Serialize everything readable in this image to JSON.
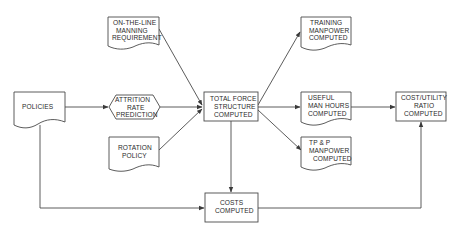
{
  "diagram": {
    "type": "flowchart",
    "background": "#ffffff",
    "line_color": "#4a4a4a",
    "text_color": "#2a2a2a",
    "nodes": [
      {
        "id": "policies",
        "shape": "document",
        "lines": [
          "POLICIES"
        ]
      },
      {
        "id": "on_the_line",
        "shape": "document",
        "lines": [
          "ON-THE-LINE",
          "MANNING",
          "REQUIREMENT"
        ]
      },
      {
        "id": "attrition",
        "shape": "hexagon",
        "lines": [
          "ATTRITION",
          "RATE",
          "PREDICTION"
        ]
      },
      {
        "id": "rotation",
        "shape": "document",
        "lines": [
          "ROTATION",
          "POLICY"
        ]
      },
      {
        "id": "total_force",
        "shape": "rectangle",
        "lines": [
          "TOTAL FORCE",
          "STRUCTURE",
          "COMPUTED"
        ]
      },
      {
        "id": "training",
        "shape": "document",
        "lines": [
          "TRAINING",
          "MANPOWER",
          "COMPUTED"
        ]
      },
      {
        "id": "useful",
        "shape": "document",
        "lines": [
          "USEFUL",
          "MAN HOURS",
          "COMPUTED"
        ]
      },
      {
        "id": "tpp",
        "shape": "document",
        "lines": [
          "TP & P",
          "MANPOWER",
          "COMPUTED"
        ]
      },
      {
        "id": "cost_utility",
        "shape": "rectangle",
        "lines": [
          "COST/UTILITY",
          "RATIO",
          "COMPUTED"
        ]
      },
      {
        "id": "costs",
        "shape": "rectangle",
        "lines": [
          "COSTS",
          "COMPUTED"
        ]
      }
    ],
    "edges": [
      {
        "from": "policies",
        "to": "attrition"
      },
      {
        "from": "policies",
        "to": "costs"
      },
      {
        "from": "on_the_line",
        "to": "total_force"
      },
      {
        "from": "attrition",
        "to": "total_force"
      },
      {
        "from": "rotation",
        "to": "total_force"
      },
      {
        "from": "total_force",
        "to": "training"
      },
      {
        "from": "total_force",
        "to": "useful"
      },
      {
        "from": "total_force",
        "to": "tpp"
      },
      {
        "from": "total_force",
        "to": "costs"
      },
      {
        "from": "useful",
        "to": "cost_utility"
      },
      {
        "from": "costs",
        "to": "cost_utility"
      }
    ]
  },
  "labels": {
    "policies": [
      "POLICIES"
    ],
    "on_the_line": [
      "ON-THE-LINE",
      "MANNING",
      "REQUIREMENT"
    ],
    "attrition": [
      "ATTRITION",
      "RATE",
      "PREDICTION"
    ],
    "rotation": [
      "ROTATION",
      "POLICY"
    ],
    "total_force": [
      "TOTAL FORCE",
      "STRUCTURE",
      "COMPUTED"
    ],
    "training": [
      "TRAINING",
      "MANPOWER",
      "COMPUTED"
    ],
    "useful": [
      "USEFUL",
      "MAN HOURS",
      "COMPUTED"
    ],
    "tpp": [
      "TP & P",
      "MANPOWER",
      "COMPUTED"
    ],
    "cost_utility": [
      "COST/UTILITY",
      "RATIO",
      "COMPUTED"
    ],
    "costs": [
      "COSTS",
      "COMPUTED"
    ]
  }
}
